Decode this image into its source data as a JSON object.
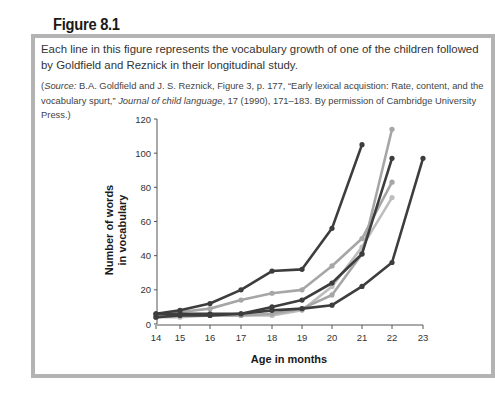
{
  "figure": {
    "label": "Figure 8.1",
    "caption": "Each line in this figure represents the vocabulary growth of one of the children followed by Goldfield and Reznick in their longitudinal study.",
    "source_prefix": "(",
    "source_label": "Source:",
    "source_text_1": " B.A. Goldfield and J. S. Reznick, Figure 3, p. 177, “Early lexical acquistion: Rate, content, and the vocabulary spurt,” ",
    "source_journal": "Journal of child language",
    "source_text_2": ", 17 (1990), 171–183. By permission of Cambridge University Press.)"
  },
  "colors": {
    "frame_border": "#b3b3b3",
    "dark_series": "#3d3d3d",
    "light_series": "#a6a6a6",
    "lighter_series": "#bdbdbd"
  },
  "chart_data": {
    "type": "line",
    "title": "",
    "xlabel": "Age in months",
    "ylabel": "Number of words in vocabulary",
    "ylabel_lines": [
      "Number of words",
      "in vocabulary"
    ],
    "x": [
      14,
      15,
      16,
      17,
      18,
      19,
      20,
      21,
      22,
      23
    ],
    "xticks": [
      "14",
      "15",
      "16",
      "17",
      "18",
      "19",
      "20",
      "21",
      "22",
      "23"
    ],
    "yticks": [
      "0",
      "20",
      "40",
      "60",
      "80",
      "100",
      "120"
    ],
    "ylim": [
      0,
      120
    ],
    "xlim": [
      14,
      23
    ],
    "grid": false,
    "legend": null,
    "series": [
      {
        "name": "Child A",
        "color": "#3d3d3d",
        "x": [
          14,
          15,
          16,
          17,
          18,
          19,
          20,
          21
        ],
        "values": [
          6,
          8,
          12,
          20,
          31,
          32,
          56,
          105
        ]
      },
      {
        "name": "Child B",
        "color": "#a6a6a6",
        "x": [
          14,
          15,
          16,
          17,
          18,
          19,
          20,
          21,
          22
        ],
        "values": [
          5,
          7,
          9,
          14,
          18,
          20,
          34,
          50,
          83
        ]
      },
      {
        "name": "Child C",
        "color": "#3d3d3d",
        "x": [
          14,
          15,
          16,
          17,
          18,
          19,
          20,
          21,
          22
        ],
        "values": [
          4,
          5,
          5,
          6,
          10,
          14,
          24,
          41,
          97
        ]
      },
      {
        "name": "Child D",
        "color": "#a6a6a6",
        "x": [
          14,
          15,
          16,
          17,
          18,
          19,
          20,
          21,
          22
        ],
        "values": [
          4,
          5,
          5,
          5,
          6,
          9,
          17,
          41,
          114
        ]
      },
      {
        "name": "Child E",
        "color": "#bdbdbd",
        "x": [
          14,
          15,
          16,
          17,
          18,
          19,
          20,
          21,
          22
        ],
        "values": [
          4,
          4,
          5,
          5,
          5,
          8,
          22,
          45,
          74
        ]
      },
      {
        "name": "Child F",
        "color": "#3d3d3d",
        "x": [
          14,
          15,
          16,
          17,
          18,
          19,
          20,
          21,
          22,
          23
        ],
        "values": [
          6,
          6,
          6,
          6,
          8,
          9,
          11,
          22,
          36,
          97
        ]
      }
    ]
  }
}
